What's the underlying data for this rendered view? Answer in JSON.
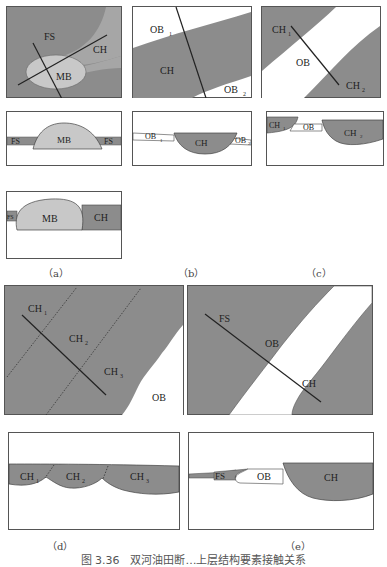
{
  "figure": {
    "caption": "图 3.36　双河油田断…上层结构要素接触关系",
    "subfigure_labels": [
      "（a）",
      "（b）",
      "（c）",
      "（d）",
      "（e）"
    ]
  },
  "colors": {
    "dark_gray": "#8c8c8c",
    "light_gray": "#c8c8c8",
    "white": "#ffffff",
    "line": "#222222"
  },
  "panels": {
    "a_plan": {
      "labels": {
        "fs": "FS",
        "ch": "CH",
        "mb": "MB"
      }
    },
    "a_section1": {
      "labels": {
        "fs_left": "FS",
        "mb": "MB",
        "fs_right": "FS"
      }
    },
    "a_section2": {
      "labels": {
        "fs": "FS",
        "mb": "MB",
        "ch": "CH"
      }
    },
    "b_plan": {
      "labels": {
        "ob1": "OB",
        "ob1_sub": "1",
        "ch": "CH",
        "ob2": "OB",
        "ob2_sub": "2"
      }
    },
    "b_section": {
      "labels": {
        "ob1": "OB",
        "ob1_sub": "1",
        "ch": "CH",
        "ob2": "OB",
        "ob2_sub": "2"
      }
    },
    "c_plan": {
      "labels": {
        "ch1": "CH",
        "ch1_sub": "1",
        "ob": "OB",
        "ch2": "CH",
        "ch2_sub": "2"
      }
    },
    "c_section": {
      "labels": {
        "ch1": "CH",
        "ch1_sub": "1",
        "ob": "OB",
        "ch2": "CH",
        "ch2_sub": "2"
      }
    },
    "d_plan": {
      "labels": {
        "ch1": "CH",
        "ch1_sub": "1",
        "ch2": "CH",
        "ch2_sub": "2",
        "ch3": "CH",
        "ch3_sub": "3",
        "ob": "OB"
      }
    },
    "d_section": {
      "labels": {
        "ch1": "CH",
        "ch1_sub": "1",
        "ch2": "CH",
        "ch2_sub": "2",
        "ch3": "CH",
        "ch3_sub": "3"
      }
    },
    "e_plan": {
      "labels": {
        "fs": "FS",
        "ob": "OB",
        "ch": "CH"
      }
    },
    "e_section": {
      "labels": {
        "fs": "FS",
        "ob": "OB",
        "ch": "CH"
      }
    }
  }
}
